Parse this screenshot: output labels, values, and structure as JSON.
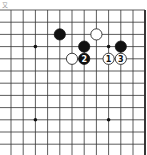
{
  "diagram": {
    "label": "又",
    "board_view": "top-left corner region, right edge visible",
    "grid": {
      "columns": 11,
      "rows": 12,
      "right_edge": true
    },
    "star_points": [
      [
        2,
        3
      ],
      [
        8,
        3
      ],
      [
        2,
        9
      ],
      [
        8,
        9
      ]
    ],
    "stones": [
      {
        "col": 4,
        "row": 2,
        "color": "black",
        "label": ""
      },
      {
        "col": 7,
        "row": 2,
        "color": "white",
        "label": ""
      },
      {
        "col": 6,
        "row": 3,
        "color": "black",
        "label": ""
      },
      {
        "col": 9,
        "row": 3,
        "color": "black",
        "label": ""
      },
      {
        "col": 5,
        "row": 4,
        "color": "white",
        "label": ""
      },
      {
        "col": 6,
        "row": 4,
        "color": "black",
        "label": "2"
      },
      {
        "col": 8,
        "row": 4,
        "color": "white",
        "label": "1"
      },
      {
        "col": 9,
        "row": 4,
        "color": "white",
        "label": "3"
      }
    ]
  }
}
